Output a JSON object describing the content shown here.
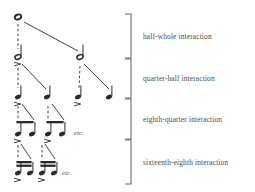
{
  "figure": {
    "background_color": "#ffffff",
    "ink_color": "#2b2b2b",
    "label_color": "#4a4a4a",
    "width": 255,
    "height": 192
  },
  "brackets": [
    {
      "id": "bracket-half-whole",
      "label": "half-whole interaction",
      "x": 131,
      "y_top": 14,
      "y_bottom": 58,
      "tick_length": 6,
      "label_x": 143,
      "label_y": 33
    },
    {
      "id": "bracket-quarter-half",
      "label": "quarter-half interaction",
      "x": 131,
      "y_top": 59,
      "y_bottom": 98,
      "tick_length": 6,
      "label_x": 143,
      "label_y": 75
    },
    {
      "id": "bracket-eighth-quarter",
      "label": "eighth-quarter interaction",
      "x": 131,
      "y_top": 99,
      "y_bottom": 139,
      "tick_length": 6,
      "label_x": 143,
      "label_y": 116
    },
    {
      "id": "bracket-sixteenth-eighth",
      "label": "sixteenth-eighth interaction",
      "x": 131,
      "y_top": 140,
      "y_bottom": 184,
      "tick_length": 6,
      "label_x": 143,
      "label_y": 159
    }
  ],
  "levels": [
    {
      "id": "level-whole",
      "note_value": "whole",
      "y": 17,
      "count": 1
    },
    {
      "id": "level-half",
      "note_value": "half",
      "y": 57,
      "count": 2
    },
    {
      "id": "level-quarter",
      "note_value": "quarter",
      "y": 97,
      "count": 4
    },
    {
      "id": "level-eighth",
      "note_value": "eighth",
      "y": 134,
      "count": 4
    },
    {
      "id": "level-sixteenth",
      "note_value": "sixteenth",
      "y": 173,
      "count": 4
    }
  ],
  "notes": [
    {
      "id": "note-whole-1",
      "value": "whole",
      "x": 18,
      "y": 17,
      "head": "open",
      "stem": false,
      "flags": 0,
      "accent": false
    },
    {
      "id": "note-half-1",
      "value": "half",
      "x": 18,
      "y": 57,
      "head": "open",
      "stem": true,
      "flags": 0,
      "accent": true
    },
    {
      "id": "note-half-2",
      "value": "half",
      "x": 80,
      "y": 57,
      "head": "open",
      "stem": true,
      "flags": 0,
      "accent": false
    },
    {
      "id": "note-quarter-1",
      "value": "quarter",
      "x": 18,
      "y": 97,
      "head": "filled",
      "stem": true,
      "flags": 0,
      "accent": true
    },
    {
      "id": "note-quarter-2",
      "value": "quarter",
      "x": 47,
      "y": 97,
      "head": "filled",
      "stem": true,
      "flags": 0,
      "accent": false
    },
    {
      "id": "note-quarter-3",
      "value": "quarter",
      "x": 78,
      "y": 97,
      "head": "filled",
      "stem": true,
      "flags": 0,
      "accent": true
    },
    {
      "id": "note-quarter-4",
      "value": "quarter",
      "x": 109,
      "y": 97,
      "head": "filled",
      "stem": true,
      "flags": 0,
      "accent": false
    },
    {
      "id": "note-eighth-1",
      "value": "eighth",
      "x": 18,
      "y": 134,
      "head": "filled",
      "stem": true,
      "flags": 1,
      "accent": true
    },
    {
      "id": "note-eighth-2",
      "value": "eighth",
      "x": 32,
      "y": 134,
      "head": "filled",
      "stem": true,
      "flags": 1,
      "accent": false
    },
    {
      "id": "note-eighth-3",
      "value": "eighth",
      "x": 48,
      "y": 134,
      "head": "filled",
      "stem": true,
      "flags": 1,
      "accent": true
    },
    {
      "id": "note-eighth-4",
      "value": "eighth",
      "x": 62,
      "y": 134,
      "head": "filled",
      "stem": true,
      "flags": 1,
      "accent": false
    },
    {
      "id": "note-sixteenth-1",
      "value": "sixteenth",
      "x": 18,
      "y": 173,
      "head": "filled",
      "stem": true,
      "flags": 2,
      "accent": true
    },
    {
      "id": "note-sixteenth-2",
      "value": "sixteenth",
      "x": 30,
      "y": 173,
      "head": "filled",
      "stem": true,
      "flags": 2,
      "accent": false
    },
    {
      "id": "note-sixteenth-3",
      "value": "sixteenth",
      "x": 42,
      "y": 173,
      "head": "filled",
      "stem": true,
      "flags": 2,
      "accent": true
    },
    {
      "id": "note-sixteenth-4",
      "value": "sixteenth",
      "x": 54,
      "y": 173,
      "head": "filled",
      "stem": true,
      "flags": 2,
      "accent": false
    }
  ],
  "beams": [
    {
      "id": "beam-eighth-1",
      "x1": 18,
      "x2": 32,
      "y": 121,
      "strokes": 1
    },
    {
      "id": "beam-eighth-2",
      "x1": 48,
      "x2": 62,
      "y": 121,
      "strokes": 1
    },
    {
      "id": "beam-sixteenth-1",
      "x1": 18,
      "x2": 30,
      "y": 161,
      "strokes": 2
    },
    {
      "id": "beam-sixteenth-2",
      "x1": 42,
      "x2": 54,
      "y": 161,
      "strokes": 2
    }
  ],
  "branches": [
    {
      "id": "branch-whole-to-half-1",
      "x1": 18,
      "y1": 24,
      "x2": 18,
      "y2": 49,
      "style": "dashed"
    },
    {
      "id": "branch-whole-to-half-2",
      "x1": 24,
      "y1": 22,
      "x2": 78,
      "y2": 51,
      "style": "solid"
    },
    {
      "id": "branch-half1-to-qtr-1",
      "x1": 18,
      "y1": 68,
      "x2": 18,
      "y2": 88,
      "style": "dashed"
    },
    {
      "id": "branch-half1-to-qtr-2",
      "x1": 22,
      "y1": 64,
      "x2": 46,
      "y2": 89,
      "style": "solid"
    },
    {
      "id": "branch-half2-to-qtr-3",
      "x1": 80,
      "y1": 66,
      "x2": 79,
      "y2": 88,
      "style": "dashed"
    },
    {
      "id": "branch-half2-to-qtr-4",
      "x1": 84,
      "y1": 64,
      "x2": 109,
      "y2": 89,
      "style": "solid"
    },
    {
      "id": "branch-qtr1-to-8th-1",
      "x1": 18,
      "y1": 106,
      "x2": 18,
      "y2": 119,
      "style": "dashed"
    },
    {
      "id": "branch-qtr1-to-8th-2",
      "x1": 22,
      "y1": 104,
      "x2": 34,
      "y2": 120,
      "style": "solid"
    },
    {
      "id": "branch-qtr2-to-8th-3",
      "x1": 48,
      "y1": 106,
      "x2": 48,
      "y2": 119,
      "style": "dashed"
    },
    {
      "id": "branch-qtr2-to-8th-4",
      "x1": 52,
      "y1": 104,
      "x2": 64,
      "y2": 120,
      "style": "solid"
    },
    {
      "id": "branch-8th1-to-16th-1",
      "x1": 18,
      "y1": 145,
      "x2": 18,
      "y2": 158,
      "style": "dashed"
    },
    {
      "id": "branch-8th1-to-16th-2",
      "x1": 21,
      "y1": 144,
      "x2": 31,
      "y2": 159,
      "style": "solid"
    },
    {
      "id": "branch-8th2-to-16th-3",
      "x1": 42,
      "y1": 145,
      "x2": 42,
      "y2": 158,
      "style": "dashed"
    },
    {
      "id": "branch-8th2-to-16th-4",
      "x1": 45,
      "y1": 144,
      "x2": 55,
      "y2": 159,
      "style": "solid"
    }
  ],
  "etc_labels": [
    {
      "id": "etc-eighth",
      "text": "etc.",
      "x": 74,
      "y": 130
    },
    {
      "id": "etc-sixteenth",
      "text": "etc.",
      "x": 62,
      "y": 170
    }
  ]
}
